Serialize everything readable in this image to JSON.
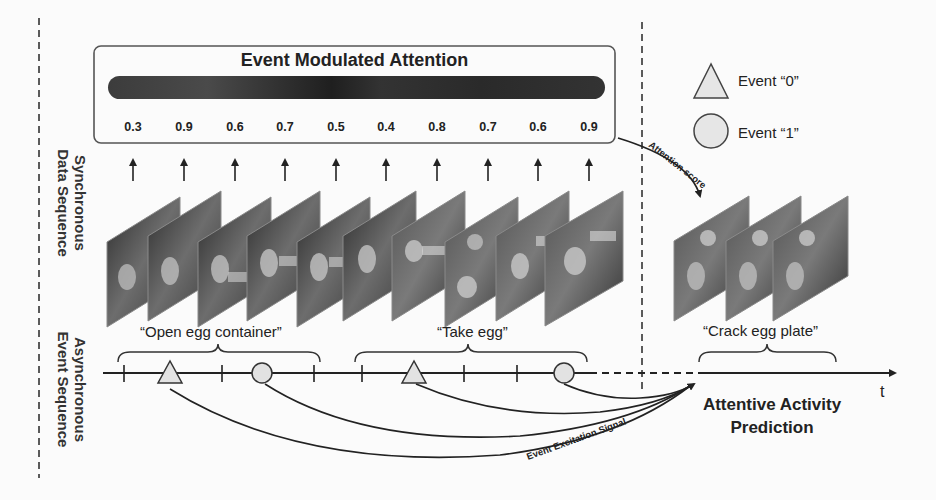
{
  "figure": {
    "attention_panel": {
      "title": "Event Modulated Attention",
      "scores": [
        "0.3",
        "0.9",
        "0.6",
        "0.7",
        "0.5",
        "0.4",
        "0.8",
        "0.7",
        "0.6",
        "0.9"
      ]
    },
    "side_labels": {
      "top": {
        "line1": "Synchronous",
        "line2": "Data Sequence"
      },
      "bottom": {
        "line1": "Asynchronous",
        "line2": "Event Sequence"
      }
    },
    "segments": [
      {
        "label": "“Open egg container”"
      },
      {
        "label": "“Take egg”"
      },
      {
        "label": "“Crack egg plate”"
      }
    ],
    "legend": [
      {
        "icon": "triangle-icon",
        "label": "Event “0”"
      },
      {
        "icon": "circle-icon",
        "label": "Event “1”"
      }
    ],
    "annotations": {
      "attention_score": "Attention score",
      "excitation_signal": "Event Excitation Signal"
    },
    "prediction": {
      "line1": "Attentive Activity",
      "line2": "Prediction"
    },
    "time_axis_label": "t",
    "colors": {
      "line": "#222222",
      "marker_fill": "#e0e0e0",
      "frame_dark": "#3a3a3a",
      "frame_mid": "#6a6a6a",
      "background": "#fbfbfb"
    }
  }
}
